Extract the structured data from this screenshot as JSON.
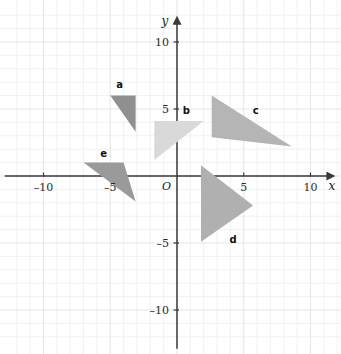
{
  "figure": {
    "title": "",
    "background_color": "#ffffff",
    "grid_color": "#efefef",
    "grid_major_color": "#e6e6e6",
    "axis_color": "#3a3a3a"
  },
  "axes": {
    "x_axis_label": "x",
    "y_axis_label": "y",
    "origin_label": "O",
    "x_ticks": [
      {
        "value": -10,
        "label": "–10"
      },
      {
        "value": -5,
        "label": "–5"
      },
      {
        "value": 5,
        "label": "5"
      },
      {
        "value": 10,
        "label": "10"
      }
    ],
    "y_ticks": [
      {
        "value": 10,
        "label": "10"
      },
      {
        "value": 5,
        "label": "5"
      },
      {
        "value": -5,
        "label": "–5"
      },
      {
        "value": -10,
        "label": "–10"
      }
    ],
    "xlim": [
      -12.8,
      12.2
    ],
    "ylim": [
      -12.8,
      12.2
    ],
    "grid": true,
    "grid_step": 1,
    "major_step": 5
  },
  "chart_data": {
    "type": "scatter",
    "title": "",
    "xlabel": "x",
    "ylabel": "y",
    "xlim": [
      -12.8,
      12.2
    ],
    "ylim": [
      -12.8,
      12.2
    ],
    "grid": true,
    "legend": "none",
    "shapes": [
      {
        "name": "a",
        "label": "a",
        "kind": "triangle",
        "fill": "#8f8f8f",
        "vertices": [
          [
            -5.0,
            6.0
          ],
          [
            -3.1,
            6.0
          ],
          [
            -3.1,
            3.3
          ]
        ],
        "label_position": [
          -4.3,
          6.9
        ]
      },
      {
        "name": "b",
        "label": "b",
        "kind": "triangle",
        "fill": "#d9d9d9",
        "vertices": [
          [
            -1.7,
            4.1
          ],
          [
            2.0,
            4.1
          ],
          [
            -1.7,
            1.2
          ]
        ],
        "label_position": [
          0.7,
          4.9
        ]
      },
      {
        "name": "c",
        "label": "c",
        "kind": "triangle",
        "fill": "#b5b5b5",
        "vertices": [
          [
            2.6,
            6.0
          ],
          [
            2.6,
            2.9
          ],
          [
            8.6,
            2.2
          ]
        ],
        "label_position": [
          5.9,
          4.9
        ]
      },
      {
        "name": "d",
        "label": "d",
        "kind": "triangle",
        "fill": "#b0b0b0",
        "vertices": [
          [
            1.8,
            0.8
          ],
          [
            1.8,
            -4.9
          ],
          [
            5.7,
            -2.2
          ]
        ],
        "label_position": [
          4.2,
          -4.7
        ]
      },
      {
        "name": "e",
        "label": "e",
        "kind": "triangle",
        "fill": "#9a9a9a",
        "vertices": [
          [
            -7.0,
            1.0
          ],
          [
            -4.0,
            1.0
          ],
          [
            -3.1,
            -1.9
          ]
        ],
        "label_position": [
          -5.5,
          1.7
        ]
      }
    ]
  }
}
